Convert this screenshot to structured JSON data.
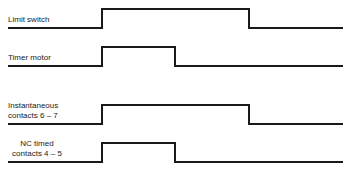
{
  "diagram": {
    "type": "timing-diagram",
    "line_color": "#1a1a1a",
    "signals": [
      {
        "id": "limit-switch",
        "label_lines": [
          "Limit switch"
        ],
        "low_y": 28,
        "high_y": 9,
        "start_x": 8,
        "rise_x": 102,
        "fall_x": 249,
        "end_x": 343
      },
      {
        "id": "timer-motor",
        "label_lines": [
          "Timer motor"
        ],
        "low_y": 66,
        "high_y": 47,
        "start_x": 8,
        "rise_x": 102,
        "fall_x": 175,
        "end_x": 343
      },
      {
        "id": "instantaneous-contacts",
        "label_lines": [
          "Instantaneous",
          "contacts 6 – 7"
        ],
        "low_y": 124,
        "high_y": 105,
        "start_x": 8,
        "rise_x": 102,
        "fall_x": 249,
        "end_x": 343
      },
      {
        "id": "nc-timed-contacts",
        "label_lines": [
          "NC timed",
          "contacts 4 – 5"
        ],
        "low_y": 162,
        "high_y": 143,
        "start_x": 8,
        "rise_x": 102,
        "fall_x": 175,
        "end_x": 343
      }
    ]
  },
  "labels": {
    "limit_switch": "Limit switch",
    "timer_motor": "Timer motor",
    "instantaneous_1": "Instantaneous",
    "instantaneous_2": "contacts 6 – 7",
    "nc_timed_1": "NC timed",
    "nc_timed_2": "contacts 4 – 5"
  }
}
